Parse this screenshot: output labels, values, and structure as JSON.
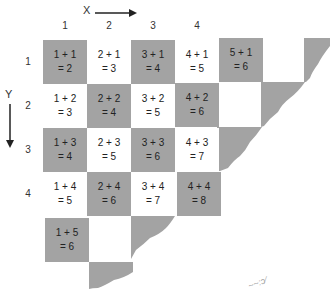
{
  "axes": {
    "x_label": "X",
    "y_label": "Y",
    "columns": [
      "1",
      "2",
      "3",
      "4"
    ],
    "rows": [
      "1",
      "2",
      "3",
      "4"
    ]
  },
  "cells": [
    {
      "col": 1,
      "row": 1,
      "expr": "1 + 1",
      "result": "= 2",
      "shade": "gray"
    },
    {
      "col": 2,
      "row": 1,
      "expr": "2 + 1",
      "result": "= 3",
      "shade": "white"
    },
    {
      "col": 3,
      "row": 1,
      "expr": "3 + 1",
      "result": "= 4",
      "shade": "gray"
    },
    {
      "col": 4,
      "row": 1,
      "expr": "4 + 1",
      "result": "= 5",
      "shade": "white"
    },
    {
      "col": 5,
      "row": 1,
      "expr": "5 + 1",
      "result": "= 6",
      "shade": "gray"
    },
    {
      "col": 1,
      "row": 2,
      "expr": "1 + 2",
      "result": "= 3",
      "shade": "white"
    },
    {
      "col": 2,
      "row": 2,
      "expr": "2 + 2",
      "result": "= 4",
      "shade": "gray"
    },
    {
      "col": 3,
      "row": 2,
      "expr": "3 + 2",
      "result": "= 5",
      "shade": "white"
    },
    {
      "col": 4,
      "row": 2,
      "expr": "4 + 2",
      "result": "= 6",
      "shade": "gray"
    },
    {
      "col": 1,
      "row": 3,
      "expr": "1 + 3",
      "result": "= 4",
      "shade": "gray"
    },
    {
      "col": 2,
      "row": 3,
      "expr": "2 + 3",
      "result": "= 5",
      "shade": "white"
    },
    {
      "col": 3,
      "row": 3,
      "expr": "3 + 3",
      "result": "= 6",
      "shade": "gray"
    },
    {
      "col": 4,
      "row": 3,
      "expr": "4 + 3",
      "result": "= 7",
      "shade": "white"
    },
    {
      "col": 1,
      "row": 4,
      "expr": "1 + 4",
      "result": "= 5",
      "shade": "white"
    },
    {
      "col": 2,
      "row": 4,
      "expr": "2 + 4",
      "result": "= 6",
      "shade": "gray"
    },
    {
      "col": 3,
      "row": 4,
      "expr": "3 + 4",
      "result": "= 7",
      "shade": "white"
    },
    {
      "col": 4,
      "row": 4,
      "expr": "4 + 4",
      "result": "= 8",
      "shade": "gray"
    },
    {
      "col": 1,
      "row": 5,
      "expr": "1 + 5",
      "result": "= 6",
      "shade": "gray"
    }
  ],
  "colors": {
    "gray": "#a3a3a3",
    "white": "#ffffff",
    "text": "#222222"
  }
}
